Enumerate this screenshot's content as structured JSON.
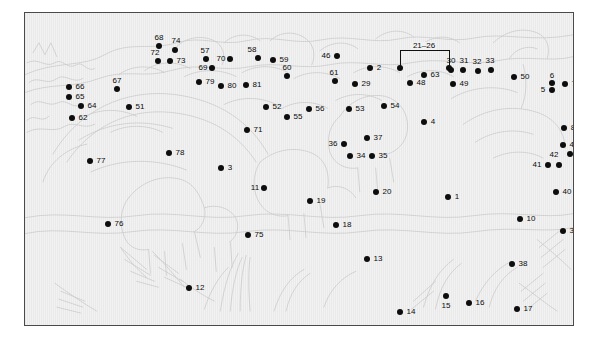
{
  "figure": {
    "kind": "numbered-identification-key",
    "width": 598,
    "height": 338,
    "background_color": "#f2f2f2",
    "frame_color": "#4a4a4a",
    "marker_color": "#0d0d0d",
    "label_color": "#0b0b0b",
    "artwork_line_color": "#cfcfcf"
  },
  "group_bracket": {
    "label": "21–26",
    "left_x": 375,
    "right_x": 424,
    "top_y": 37,
    "marker_y": 55,
    "label_x": 399,
    "label_y": 33
  },
  "markers": [
    {
      "id": "1",
      "label": "1",
      "dot_x": 423,
      "dot_y": 184,
      "label_x": 432,
      "label_y": 184
    },
    {
      "id": "2",
      "label": "2",
      "dot_x": 345,
      "dot_y": 55,
      "label_x": 354,
      "label_y": 55
    },
    {
      "id": "3",
      "label": "3",
      "dot_x": 196,
      "dot_y": 155,
      "label_x": 205,
      "label_y": 155
    },
    {
      "id": "4",
      "label": "4",
      "dot_x": 399,
      "dot_y": 109,
      "label_x": 408,
      "label_y": 109
    },
    {
      "id": "5",
      "label": "5",
      "dot_x": 527,
      "dot_y": 77,
      "label_x": 518,
      "label_y": 77
    },
    {
      "id": "6",
      "label": "6",
      "dot_x": 527,
      "dot_y": 70,
      "label_x": 527,
      "label_y": 63
    },
    {
      "id": "7",
      "label": "7",
      "dot_x": 540,
      "dot_y": 71,
      "label_x": 549,
      "label_y": 71
    },
    {
      "id": "8",
      "label": "8",
      "dot_x": 539,
      "dot_y": 115,
      "label_x": 548,
      "label_y": 115
    },
    {
      "id": "9",
      "label": "9",
      "dot_x": 559,
      "dot_y": 122,
      "label_x": 568,
      "label_y": 122
    },
    {
      "id": "10",
      "label": "10",
      "dot_x": 495,
      "dot_y": 206,
      "label_x": 506,
      "label_y": 206
    },
    {
      "id": "11",
      "label": "11",
      "dot_x": 239,
      "dot_y": 175,
      "label_x": 230,
      "label_y": 175
    },
    {
      "id": "12",
      "label": "12",
      "dot_x": 164,
      "dot_y": 275,
      "label_x": 175,
      "label_y": 275
    },
    {
      "id": "13",
      "label": "13",
      "dot_x": 342,
      "dot_y": 246,
      "label_x": 353,
      "label_y": 246
    },
    {
      "id": "14",
      "label": "14",
      "dot_x": 375,
      "dot_y": 299,
      "label_x": 386,
      "label_y": 299
    },
    {
      "id": "15",
      "label": "15",
      "dot_x": 421,
      "dot_y": 283,
      "label_x": 421,
      "label_y": 293
    },
    {
      "id": "16",
      "label": "16",
      "dot_x": 444,
      "dot_y": 290,
      "label_x": 455,
      "label_y": 290
    },
    {
      "id": "17",
      "label": "17",
      "dot_x": 492,
      "dot_y": 296,
      "label_x": 503,
      "label_y": 296
    },
    {
      "id": "18",
      "label": "18",
      "dot_x": 311,
      "dot_y": 212,
      "label_x": 322,
      "label_y": 212
    },
    {
      "id": "19",
      "label": "19",
      "dot_x": 285,
      "dot_y": 188,
      "label_x": 296,
      "label_y": 188
    },
    {
      "id": "20",
      "label": "20",
      "dot_x": 351,
      "dot_y": 179,
      "label_x": 362,
      "label_y": 179
    },
    {
      "id": "29",
      "label": "29",
      "dot_x": 330,
      "dot_y": 71,
      "label_x": 341,
      "label_y": 71
    },
    {
      "id": "30",
      "label": "30",
      "dot_x": 426,
      "dot_y": 57,
      "label_x": 426,
      "label_y": 48
    },
    {
      "id": "31",
      "label": "31",
      "dot_x": 438,
      "dot_y": 57,
      "label_x": 439,
      "label_y": 48
    },
    {
      "id": "32",
      "label": "32",
      "dot_x": 453,
      "dot_y": 58,
      "label_x": 452,
      "label_y": 49
    },
    {
      "id": "33",
      "label": "33",
      "dot_x": 466,
      "dot_y": 57,
      "label_x": 465,
      "label_y": 48
    },
    {
      "id": "34",
      "label": "34",
      "dot_x": 325,
      "dot_y": 143,
      "label_x": 336,
      "label_y": 143
    },
    {
      "id": "35",
      "label": "35",
      "dot_x": 347,
      "dot_y": 143,
      "label_x": 358,
      "label_y": 143
    },
    {
      "id": "36",
      "label": "36",
      "dot_x": 319,
      "dot_y": 131,
      "label_x": 308,
      "label_y": 131
    },
    {
      "id": "37",
      "label": "37",
      "dot_x": 342,
      "dot_y": 125,
      "label_x": 353,
      "label_y": 125
    },
    {
      "id": "38",
      "label": "38",
      "dot_x": 487,
      "dot_y": 251,
      "label_x": 498,
      "label_y": 251
    },
    {
      "id": "39",
      "label": "39",
      "dot_x": 538,
      "dot_y": 218,
      "label_x": 549,
      "label_y": 218
    },
    {
      "id": "40",
      "label": "40",
      "dot_x": 531,
      "dot_y": 179,
      "label_x": 542,
      "label_y": 179
    },
    {
      "id": "41",
      "label": "41",
      "dot_x": 523,
      "dot_y": 152,
      "label_x": 512,
      "label_y": 152
    },
    {
      "id": "42",
      "label": "42",
      "dot_x": 534,
      "dot_y": 152,
      "label_x": 529,
      "label_y": 142
    },
    {
      "id": "43",
      "label": "43",
      "dot_x": 553,
      "dot_y": 157,
      "label_x": 564,
      "label_y": 157
    },
    {
      "id": "44",
      "label": "44",
      "dot_x": 562,
      "dot_y": 148,
      "label_x": 573,
      "label_y": 148
    },
    {
      "id": "45",
      "label": "45",
      "dot_x": 545,
      "dot_y": 141,
      "label_x": 556,
      "label_y": 141
    },
    {
      "id": "46",
      "label": "46",
      "dot_x": 312,
      "dot_y": 43,
      "label_x": 301,
      "label_y": 43
    },
    {
      "id": "47",
      "label": "47",
      "dot_x": 538,
      "dot_y": 132,
      "label_x": 549,
      "label_y": 132
    },
    {
      "id": "48",
      "label": "48",
      "dot_x": 385,
      "dot_y": 70,
      "label_x": 396,
      "label_y": 70
    },
    {
      "id": "49",
      "label": "49",
      "dot_x": 428,
      "dot_y": 71,
      "label_x": 439,
      "label_y": 71
    },
    {
      "id": "50",
      "label": "50",
      "dot_x": 489,
      "dot_y": 64,
      "label_x": 500,
      "label_y": 64
    },
    {
      "id": "51",
      "label": "51",
      "dot_x": 104,
      "dot_y": 94,
      "label_x": 115,
      "label_y": 94
    },
    {
      "id": "52",
      "label": "52",
      "dot_x": 241,
      "dot_y": 94,
      "label_x": 252,
      "label_y": 94
    },
    {
      "id": "53",
      "label": "53",
      "dot_x": 324,
      "dot_y": 96,
      "label_x": 335,
      "label_y": 96
    },
    {
      "id": "54",
      "label": "54",
      "dot_x": 359,
      "dot_y": 93,
      "label_x": 370,
      "label_y": 93
    },
    {
      "id": "55",
      "label": "55",
      "dot_x": 262,
      "dot_y": 104,
      "label_x": 273,
      "label_y": 104
    },
    {
      "id": "56",
      "label": "56",
      "dot_x": 284,
      "dot_y": 96,
      "label_x": 295,
      "label_y": 96
    },
    {
      "id": "57",
      "label": "57",
      "dot_x": 181,
      "dot_y": 46,
      "label_x": 180,
      "label_y": 38
    },
    {
      "id": "58",
      "label": "58",
      "dot_x": 233,
      "dot_y": 45,
      "label_x": 227,
      "label_y": 37
    },
    {
      "id": "59",
      "label": "59",
      "dot_x": 248,
      "dot_y": 47,
      "label_x": 259,
      "label_y": 47
    },
    {
      "id": "60",
      "label": "60",
      "dot_x": 262,
      "dot_y": 63,
      "label_x": 262,
      "label_y": 55
    },
    {
      "id": "61",
      "label": "61",
      "dot_x": 310,
      "dot_y": 68,
      "label_x": 309,
      "label_y": 60
    },
    {
      "id": "62",
      "label": "62",
      "dot_x": 47,
      "dot_y": 105,
      "label_x": 58,
      "label_y": 105
    },
    {
      "id": "63",
      "label": "63",
      "dot_x": 399,
      "dot_y": 62,
      "label_x": 410,
      "label_y": 62
    },
    {
      "id": "64",
      "label": "64",
      "dot_x": 56,
      "dot_y": 93,
      "label_x": 67,
      "label_y": 93
    },
    {
      "id": "65",
      "label": "65",
      "dot_x": 44,
      "dot_y": 84,
      "label_x": 55,
      "label_y": 84
    },
    {
      "id": "66",
      "label": "66",
      "dot_x": 44,
      "dot_y": 74,
      "label_x": 55,
      "label_y": 74
    },
    {
      "id": "67",
      "label": "67",
      "dot_x": 92,
      "dot_y": 76,
      "label_x": 92,
      "label_y": 68
    },
    {
      "id": "68",
      "label": "68",
      "dot_x": 134,
      "dot_y": 33,
      "label_x": 134,
      "label_y": 25
    },
    {
      "id": "69",
      "label": "69",
      "dot_x": 187,
      "dot_y": 55,
      "label_x": 178,
      "label_y": 55
    },
    {
      "id": "70",
      "label": "70",
      "dot_x": 205,
      "dot_y": 46,
      "label_x": 196,
      "label_y": 46
    },
    {
      "id": "71",
      "label": "71",
      "dot_x": 222,
      "dot_y": 117,
      "label_x": 233,
      "label_y": 117
    },
    {
      "id": "72",
      "label": "72",
      "dot_x": 133,
      "dot_y": 48,
      "label_x": 130,
      "label_y": 40
    },
    {
      "id": "73",
      "label": "73",
      "dot_x": 145,
      "dot_y": 48,
      "label_x": 156,
      "label_y": 48
    },
    {
      "id": "74",
      "label": "74",
      "dot_x": 150,
      "dot_y": 37,
      "label_x": 151,
      "label_y": 28
    },
    {
      "id": "75",
      "label": "75",
      "dot_x": 223,
      "dot_y": 222,
      "label_x": 234,
      "label_y": 222
    },
    {
      "id": "76",
      "label": "76",
      "dot_x": 83,
      "dot_y": 211,
      "label_x": 94,
      "label_y": 211
    },
    {
      "id": "77",
      "label": "77",
      "dot_x": 65,
      "dot_y": 148,
      "label_x": 76,
      "label_y": 148
    },
    {
      "id": "78",
      "label": "78",
      "dot_x": 144,
      "dot_y": 140,
      "label_x": 155,
      "label_y": 140
    },
    {
      "id": "79",
      "label": "79",
      "dot_x": 174,
      "dot_y": 69,
      "label_x": 185,
      "label_y": 69
    },
    {
      "id": "80",
      "label": "80",
      "dot_x": 196,
      "dot_y": 73,
      "label_x": 207,
      "label_y": 73
    },
    {
      "id": "81",
      "label": "81",
      "dot_x": 221,
      "dot_y": 72,
      "label_x": 232,
      "label_y": 72
    }
  ]
}
